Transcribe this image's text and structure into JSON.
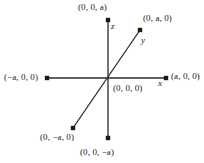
{
  "figure": {
    "background_color": "#ffffff",
    "line_color": "#2b2b2b",
    "text_color": "#1a1a1a",
    "origin_px": {
      "x": 108,
      "y": 78
    },
    "axes": [
      {
        "name": "x",
        "letter": "x",
        "orientation": "horizontal",
        "start_px": {
          "x": 47,
          "y": 78
        },
        "end_px": {
          "x": 166,
          "y": 78
        }
      },
      {
        "name": "y",
        "letter": "y",
        "orientation": "diagonal",
        "start_px": {
          "x": 73,
          "y": 128
        },
        "end_px": {
          "x": 140,
          "y": 30
        }
      },
      {
        "name": "z",
        "letter": "z",
        "orientation": "vertical",
        "start_px": {
          "x": 108,
          "y": 138
        },
        "end_px": {
          "x": 108,
          "y": 20
        }
      }
    ],
    "points": [
      {
        "id": "z-pos",
        "label": "(0, 0, a)",
        "dot_px": {
          "x": 108,
          "y": 20
        }
      },
      {
        "id": "y-pos",
        "label": "(0, a, 0)",
        "dot_px": {
          "x": 140,
          "y": 30
        }
      },
      {
        "id": "x-neg",
        "label": "(−a, 0, 0)",
        "dot_px": {
          "x": 47,
          "y": 78
        }
      },
      {
        "id": "x-pos",
        "label": "(a, 0, 0)",
        "dot_px": {
          "x": 166,
          "y": 78
        }
      },
      {
        "id": "origin",
        "label": "(0, 0, 0)",
        "dot_px": {
          "x": 108,
          "y": 78
        }
      },
      {
        "id": "y-neg",
        "label": "(0, −a, 0)",
        "dot_px": {
          "x": 73,
          "y": 128
        }
      },
      {
        "id": "z-neg",
        "label": "(0, 0, −a)",
        "dot_px": {
          "x": 108,
          "y": 138
        }
      }
    ]
  }
}
